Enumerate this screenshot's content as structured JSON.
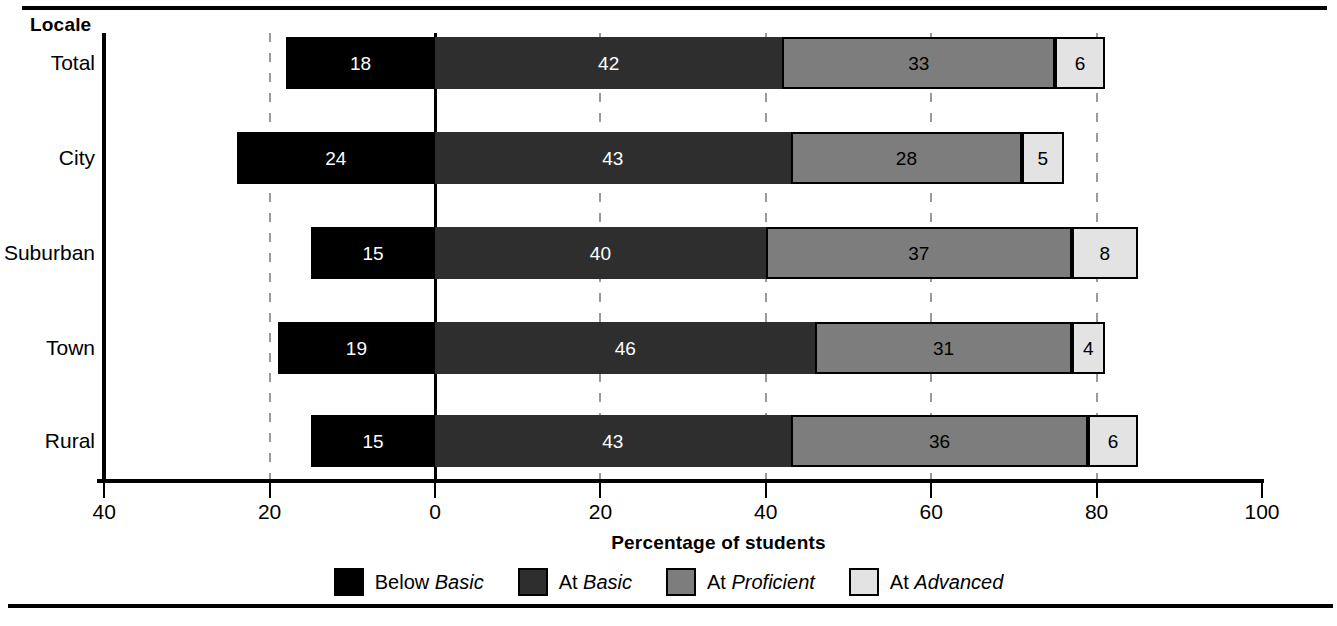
{
  "chart_data": {
    "type": "bar",
    "subtype": "diverging-stacked-bar",
    "title": "",
    "xlabel": "Percentage of students",
    "ylabel": "Locale",
    "categories": [
      "Total",
      "City",
      "Suburban",
      "Town",
      "Rural"
    ],
    "series": [
      {
        "name": "Below Basic",
        "values": [
          18,
          24,
          15,
          19,
          15
        ]
      },
      {
        "name": "At Basic",
        "values": [
          42,
          43,
          40,
          46,
          43
        ]
      },
      {
        "name": "At Proficient",
        "values": [
          33,
          28,
          37,
          31,
          36
        ]
      },
      {
        "name": "At Advanced",
        "values": [
          6,
          5,
          8,
          4,
          6
        ]
      }
    ],
    "xlim": [
      -40,
      100
    ],
    "xticks": [
      -40,
      -20,
      0,
      20,
      40,
      60,
      80,
      100
    ],
    "xtick_labels": [
      "40",
      "20",
      "0",
      "20",
      "40",
      "60",
      "80",
      "100"
    ],
    "grid": "dashed vertical at -20, 20, 40, 60, 80; solid at 0",
    "legend_position": "bottom",
    "colors": {
      "below_basic": "#000000",
      "at_basic": "#2e2e2e",
      "at_proficient": "#7d7d7d",
      "at_advanced": "#e3e3e3",
      "background": "#ffffff",
      "axis": "#000000",
      "gridline": "#9a9a9a"
    }
  },
  "axis": {
    "y_title": "Locale",
    "x_title": "Percentage of students",
    "ticks": [
      {
        "label": "40",
        "value": -40
      },
      {
        "label": "20",
        "value": -20
      },
      {
        "label": "0",
        "value": 0
      },
      {
        "label": "20",
        "value": 20
      },
      {
        "label": "40",
        "value": 40
      },
      {
        "label": "60",
        "value": 60
      },
      {
        "label": "80",
        "value": 80
      },
      {
        "label": "100",
        "value": 100
      }
    ]
  },
  "rows": [
    {
      "label": "Total",
      "below_basic": "18",
      "at_basic": "42",
      "at_proficient": "33",
      "at_advanced": "6"
    },
    {
      "label": "City",
      "below_basic": "24",
      "at_basic": "43",
      "at_proficient": "28",
      "at_advanced": "5"
    },
    {
      "label": "Suburban",
      "below_basic": "15",
      "at_basic": "40",
      "at_proficient": "37",
      "at_advanced": "8"
    },
    {
      "label": "Town",
      "below_basic": "19",
      "at_basic": "46",
      "at_proficient": "31",
      "at_advanced": "4"
    },
    {
      "label": "Rural",
      "below_basic": "15",
      "at_basic": "43",
      "at_proficient": "36",
      "at_advanced": "6"
    }
  ],
  "legend": [
    {
      "prefix": "Below ",
      "level": "Basic",
      "swatch": "below-basic-swatch"
    },
    {
      "prefix": "At ",
      "level": "Basic",
      "swatch": "at-basic-swatch"
    },
    {
      "prefix": "At ",
      "level": "Proficient",
      "swatch": "at-proficient-swatch"
    },
    {
      "prefix": "At ",
      "level": "Advanced",
      "swatch": "at-advanced-swatch"
    }
  ]
}
